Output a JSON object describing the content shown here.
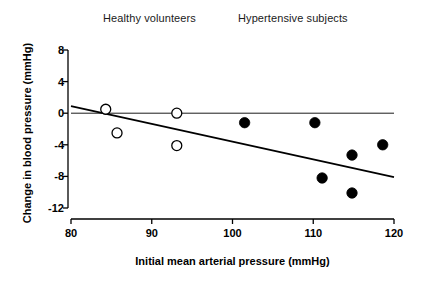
{
  "chart_data": {
    "type": "scatter",
    "title": "",
    "xlabel": "Initial mean arterial pressure (mmHg)",
    "ylabel": "Change in blood pressure (mmHg)",
    "xlim": [
      80,
      120
    ],
    "ylim": [
      -12,
      8
    ],
    "xticks": [
      80,
      90,
      100,
      110,
      120
    ],
    "yticks": [
      8,
      4,
      0,
      -4,
      -8,
      -12
    ],
    "xtick_labels": [
      "80",
      "90",
      "100",
      "110",
      "120"
    ],
    "ytick_labels": [
      "8",
      "4",
      "0",
      "-4",
      "-8",
      "-12"
    ],
    "grid": false,
    "legend_position": "top-inside-annotations",
    "annotations": [
      {
        "text": "Healthy volunteers",
        "x": 87.5,
        "y": 9.8
      },
      {
        "text": "Hypertensive subjects",
        "x": 106.5,
        "y": 9.8
      }
    ],
    "zero_reference_line": {
      "y": 0,
      "x_start": 80,
      "x_end": 120
    },
    "regression_line": {
      "x_start": 80,
      "y_start": 0.9,
      "x_end": 120,
      "y_end": -8.1
    },
    "series": [
      {
        "name": "Healthy volunteers",
        "marker": "open-circle",
        "color": "#000000",
        "fill": "#ffffff",
        "points": [
          {
            "x": 84.3,
            "y": 0.5
          },
          {
            "x": 85.7,
            "y": -2.5
          },
          {
            "x": 93.1,
            "y": 0.0
          },
          {
            "x": 93.1,
            "y": -4.1
          }
        ]
      },
      {
        "name": "Hypertensive subjects",
        "marker": "filled-circle",
        "color": "#000000",
        "fill": "#000000",
        "points": [
          {
            "x": 101.5,
            "y": -1.2
          },
          {
            "x": 110.2,
            "y": -1.2
          },
          {
            "x": 111.1,
            "y": -8.2
          },
          {
            "x": 114.8,
            "y": -5.3
          },
          {
            "x": 114.8,
            "y": -10.1
          },
          {
            "x": 118.6,
            "y": -4.0
          }
        ]
      }
    ]
  },
  "figure": {
    "background": "#ffffff",
    "axis_color": "#000000",
    "text_color": "#000000"
  }
}
